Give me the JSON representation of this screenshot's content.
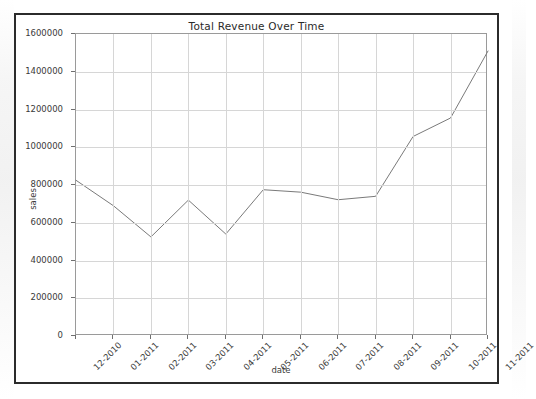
{
  "figure": {
    "title": "Total Revenue Over Time",
    "line_color": "#7a7a7a",
    "grid_color": "#d6d6d6",
    "frame_color": "#2b2b2b",
    "axis_color": "#9a9a9a"
  },
  "chart_data": {
    "type": "line",
    "title": "Total Revenue Over Time",
    "xlabel": "date",
    "ylabel": "sales",
    "categories": [
      "12-2010",
      "01-2011",
      "02-2011",
      "03-2011",
      "04-2011",
      "05-2011",
      "06-2011",
      "07-2011",
      "08-2011",
      "09-2011",
      "10-2011",
      "11-2011"
    ],
    "values": [
      825000,
      690000,
      525000,
      720000,
      540000,
      775000,
      762000,
      722000,
      740000,
      1057000,
      1155000,
      1510000
    ],
    "series": [
      {
        "name": "sales",
        "values": [
          825000,
          690000,
          525000,
          720000,
          540000,
          775000,
          762000,
          722000,
          740000,
          1057000,
          1155000,
          1510000
        ]
      }
    ],
    "ylim": [
      0,
      1600000
    ],
    "yticks": [
      0,
      200000,
      400000,
      600000,
      800000,
      1000000,
      1200000,
      1400000,
      1600000
    ],
    "ytick_labels": [
      "0",
      "200000",
      "400000",
      "600000",
      "800000",
      "1000000",
      "1200000",
      "1400000",
      "1600000"
    ],
    "xtick_labels": [
      "12-2010",
      "01-2011",
      "02-2011",
      "03-2011",
      "04-2011",
      "05-2011",
      "06-2011",
      "07-2011",
      "08-2011",
      "09-2011",
      "10-2011",
      "11-2011"
    ],
    "xtick_rotation": -45,
    "grid": true,
    "legend": false,
    "legend_position": "none",
    "marker": "none",
    "linewidth": 1
  }
}
